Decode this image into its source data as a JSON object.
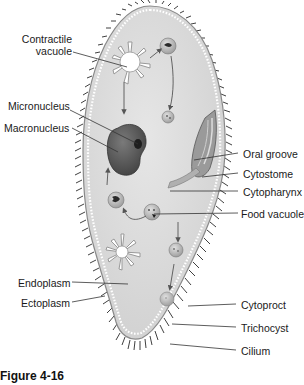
{
  "figure": {
    "caption": "Figure 4-16",
    "colors": {
      "body_fill": "#d9d9d9",
      "body_outline": "#8a8a8a",
      "cilia": "#2a2a2a",
      "macronucleus": "#5a5a5a",
      "micronucleus": "#1e1e1e",
      "vacuole_fill": "#ffffff",
      "food_vacuole": "#b8b8b8",
      "label_text": "#1a1a1a",
      "leader_line": "#333333"
    }
  },
  "labels": {
    "left": [
      {
        "id": "contractile-vacuole",
        "text_line1": "Contractile",
        "text_line2": "vacuole"
      },
      {
        "id": "micronucleus",
        "text": "Micronucleus"
      },
      {
        "id": "macronucleus",
        "text": "Macronucleus"
      },
      {
        "id": "endoplasm",
        "text": "Endoplasm"
      },
      {
        "id": "ectoplasm",
        "text": "Ectoplasm"
      }
    ],
    "right": [
      {
        "id": "oral-groove",
        "text": "Oral groove"
      },
      {
        "id": "cytostome",
        "text": "Cytostome"
      },
      {
        "id": "cytopharynx",
        "text": "Cytopharynx"
      },
      {
        "id": "food-vacuole",
        "text": "Food vacuole"
      },
      {
        "id": "cytoproct",
        "text": "Cytoproct"
      },
      {
        "id": "trichocyst",
        "text": "Trichocyst"
      },
      {
        "id": "cilium",
        "text": "Cilium"
      }
    ]
  }
}
